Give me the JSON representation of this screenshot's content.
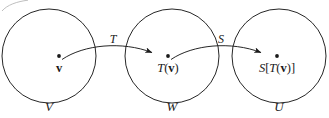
{
  "figure": {
    "stroke_color": "#1a1a1a",
    "background_color": "#ffffff",
    "sets": [
      {
        "id": "domain",
        "label": "V",
        "cx": 49,
        "cy": 56,
        "r": 47
      },
      {
        "id": "codomain-1",
        "label": "W",
        "cx": 172,
        "cy": 56,
        "r": 47
      },
      {
        "id": "codomain-2",
        "label": "U",
        "cx": 279,
        "cy": 56,
        "r": 47
      }
    ],
    "points": [
      {
        "id": "v",
        "label_plain": "v",
        "label_parts": [
          {
            "t": "v",
            "style": "vec"
          }
        ],
        "x": 59,
        "y": 62
      },
      {
        "id": "Tv",
        "label_plain": "T(v)",
        "label_parts": [
          {
            "t": "T",
            "style": "it"
          },
          {
            "t": "(",
            "style": "rm"
          },
          {
            "t": "v",
            "style": "vec"
          },
          {
            "t": ")",
            "style": "rm"
          }
        ],
        "x": 168,
        "y": 62
      },
      {
        "id": "STv",
        "label_plain": "S[T(v)]",
        "label_parts": [
          {
            "t": "S",
            "style": "it"
          },
          {
            "t": "[",
            "style": "rm"
          },
          {
            "t": "T",
            "style": "it"
          },
          {
            "t": "(",
            "style": "rm"
          },
          {
            "t": "v",
            "style": "vec"
          },
          {
            "t": ")]",
            "style": "rm"
          }
        ],
        "x": 277,
        "y": 62
      }
    ],
    "arrows": [
      {
        "id": "T",
        "label": "T",
        "from": "v",
        "to": "Tv",
        "label_x": 113,
        "label_y": 33
      },
      {
        "id": "S",
        "label": "S",
        "from": "Tv",
        "to": "STv",
        "label_x": 221,
        "label_y": 33
      }
    ]
  }
}
